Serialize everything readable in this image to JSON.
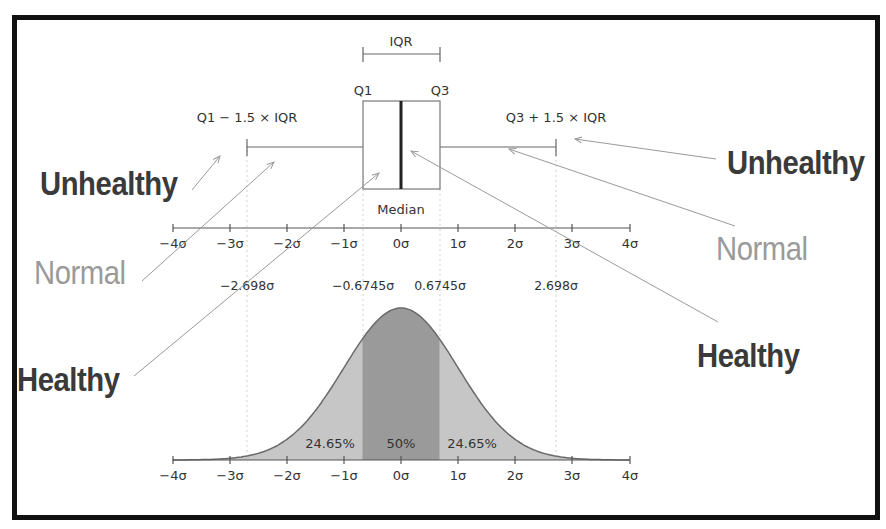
{
  "colors": {
    "frame": "#111111",
    "axis": "#555555",
    "curve_fill_outer": "#c6c6c6",
    "curve_fill_iqr": "#9a9a9a",
    "curve_outline": "#6a6a6a",
    "label_dark": "#3a3a3a",
    "label_normal": "#9a9a9a",
    "arrow": "#9a9a9a"
  },
  "boxplot": {
    "iqr_label": "IQR",
    "q1_label": "Q1",
    "q3_label": "Q3",
    "lower_whisker_label": "Q1 − 1.5 × IQR",
    "upper_whisker_label": "Q3 + 1.5 × IQR",
    "median_label": "Median"
  },
  "axis_ticks": [
    "−4σ",
    "−3σ",
    "−2σ",
    "−1σ",
    "0σ",
    "1σ",
    "2σ",
    "3σ",
    "4σ"
  ],
  "reference_values": [
    "−2.698σ",
    "−0.6745σ",
    "0.6745σ",
    "2.698σ"
  ],
  "distribution": {
    "left_pct": "24.65%",
    "center_pct": "50%",
    "right_pct": "24.65%"
  },
  "annotations": {
    "left": {
      "unhealthy": "Unhealthy",
      "normal": "Normal",
      "healthy": "Healthy"
    },
    "right": {
      "unhealthy": "Unhealthy",
      "normal": "Normal",
      "healthy": "Healthy"
    }
  },
  "chart_data": {
    "type": "area",
    "xlabel": "σ",
    "x_ticks": [
      -4,
      -3,
      -2,
      -1,
      0,
      1,
      2,
      3,
      4
    ],
    "boxplot": {
      "lower_whisker": -2.698,
      "q1": -0.6745,
      "median": 0,
      "q3": 0.6745,
      "upper_whisker": 2.698
    },
    "regions": [
      {
        "range": [
          -2.698,
          -0.6745
        ],
        "label": "24.65%",
        "value": 24.65
      },
      {
        "range": [
          -0.6745,
          0.6745
        ],
        "label": "50%",
        "value": 50
      },
      {
        "range": [
          0.6745,
          2.698
        ],
        "label": "24.65%",
        "value": 24.65
      }
    ],
    "curve": "standard normal pdf",
    "xlim": [
      -4,
      4
    ]
  }
}
